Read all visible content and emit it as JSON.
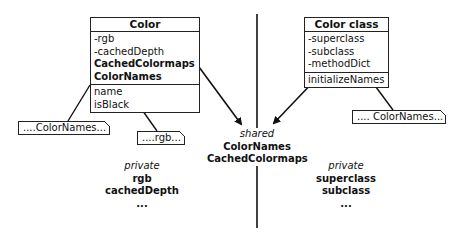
{
  "color_box": {
    "title": "Color",
    "attributes": [
      "-rgb",
      "-cachedDepth",
      "CachedColormaps",
      "ColorNames"
    ],
    "attribute_bold": [
      false,
      false,
      true,
      true
    ],
    "methods": [
      "name",
      "isBlack"
    ]
  },
  "color_class_box": {
    "title": "Color class",
    "attributes": [
      "-superclass",
      "-subclass",
      "-methodDict"
    ],
    "methods": [
      "initializeNames"
    ]
  },
  "notes": {
    "name_note": "....ColorNames...",
    "isblack_note": "....rgb...",
    "initialize_note": ".... ColorNames..."
  },
  "shared": {
    "header": "shared",
    "items": [
      "ColorNames",
      "CachedColormaps"
    ]
  },
  "private_left": {
    "header": "private",
    "items": [
      "rgb",
      "cachedDepth",
      "..."
    ]
  },
  "private_right": {
    "header": "private",
    "items": [
      "superclass",
      "subclass",
      "..."
    ]
  }
}
